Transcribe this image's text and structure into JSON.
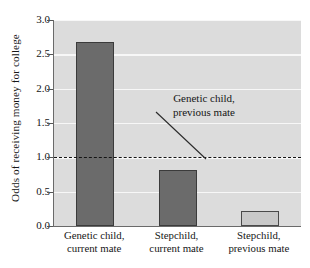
{
  "chart_data": {
    "type": "bar",
    "title": "",
    "xlabel": "",
    "ylabel": "Odds of receiving money for college",
    "ylim": [
      0.0,
      3.0
    ],
    "ytick_labels": [
      "3.0",
      "2.5",
      "2.0",
      "1.5",
      "1.0",
      "0.5",
      "0.0"
    ],
    "ytick_values": [
      3.0,
      2.5,
      2.0,
      1.5,
      1.0,
      0.5,
      0.0
    ],
    "grid": true,
    "legend_position": "none",
    "categories": [
      "Genetic child, current mate",
      "Stepchild, current mate",
      "Stepchild, previous mate"
    ],
    "category_lines": [
      [
        "Genetic child,",
        "current mate"
      ],
      [
        "Stepchild,",
        "current mate"
      ],
      [
        "Stepchild,",
        "previous mate"
      ]
    ],
    "values": [
      2.68,
      0.81,
      0.22
    ],
    "bar_styles": [
      "dark",
      "dark",
      "light"
    ],
    "reference_line": {
      "value": 1.0,
      "style": "dashed",
      "label_lines": [
        "Genetic child,",
        "previous mate"
      ],
      "label": "Genetic child, previous mate"
    },
    "annotations": [
      {
        "text": "Genetic child, previous mate",
        "lines": [
          "Genetic child,",
          "previous mate"
        ],
        "points_to": "reference-line-at-1.0"
      }
    ]
  },
  "colors": {
    "plot_background": "#dcdcdc",
    "gridline": "#f7f7f7",
    "bar_dark_fill": "#6b6b6b",
    "bar_dark_edge": "#3b3b3b",
    "bar_light_fill": "#c9c9c9",
    "bar_light_edge": "#4a4a4a",
    "axis": "#6a6a6a",
    "text": "#161616",
    "reference_line": "#141414",
    "page_background": "#ffffff"
  }
}
